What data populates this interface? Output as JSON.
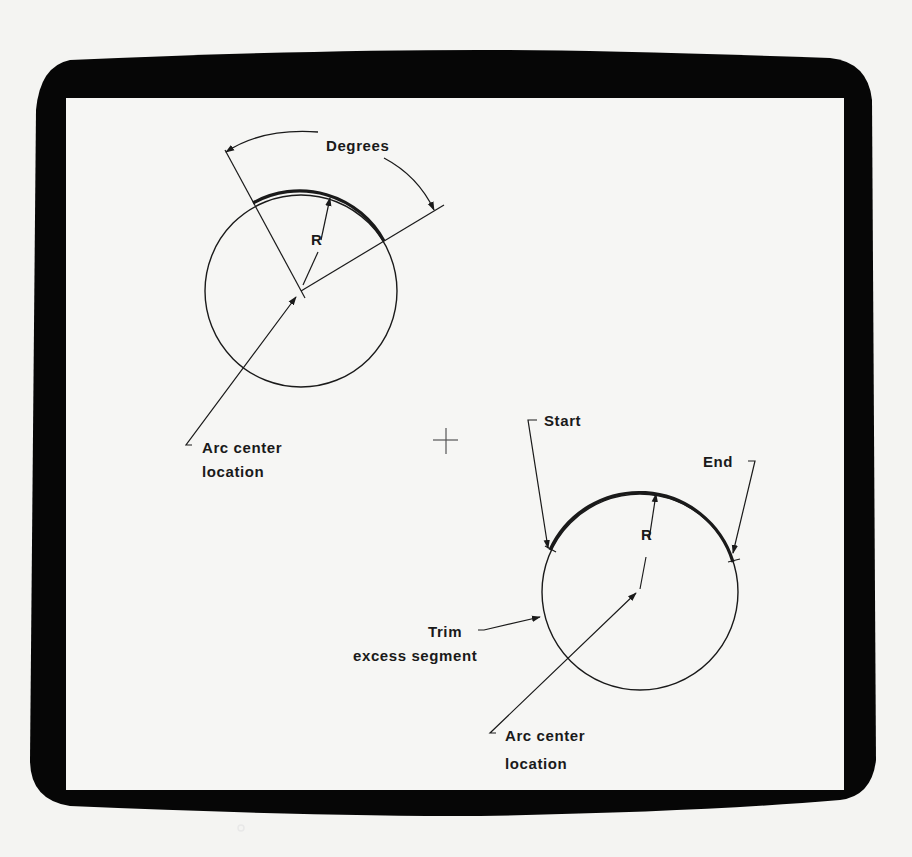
{
  "figure": {
    "colors": {
      "bezel": "#060606",
      "screen": "#f6f6f4",
      "page": "#f4f4f2",
      "ink": "#1a1a1a"
    }
  },
  "diagram_top": {
    "title": "Arc by center, radius and degrees",
    "degrees_label": "Degrees",
    "radius_label": "R",
    "center_label_line1": "Arc center",
    "center_label_line2": "location"
  },
  "cursor": {
    "icon": "crosshair-cursor-icon"
  },
  "diagram_bottom": {
    "title": "Arc by center, radius, start and end",
    "start_label": "Start",
    "end_label": "End",
    "radius_label": "R",
    "trim_label_line1": "Trim",
    "trim_label_line2": "excess segment",
    "center_label_line1": "Arc center",
    "center_label_line2": "location"
  },
  "bezel": {
    "indicator_icon": "power-led-icon"
  }
}
